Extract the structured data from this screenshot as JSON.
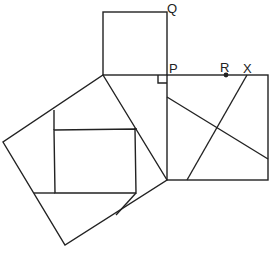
{
  "diagram": {
    "type": "pythagorean-dissection",
    "labels": {
      "Q": "Q",
      "P": "P",
      "R": "R",
      "X": "X"
    },
    "colors": {
      "stroke": "#222222",
      "background": "#ffffff"
    },
    "shapes": {
      "small_square": [
        [
          103,
          12
        ],
        [
          167,
          12
        ],
        [
          167,
          75
        ],
        [
          103,
          75
        ]
      ],
      "right_square": [
        [
          167,
          75
        ],
        [
          268,
          75
        ],
        [
          268,
          180
        ],
        [
          167,
          180
        ]
      ],
      "hypotenuse_square": [
        [
          103,
          75
        ],
        [
          167,
          180
        ],
        [
          65,
          245
        ],
        [
          3,
          142
        ]
      ],
      "inner_square": [
        [
          54,
          130
        ],
        [
          135,
          129
        ],
        [
          136,
          193
        ],
        [
          55,
          193
        ]
      ]
    },
    "points": {
      "R": [
        226,
        75
      ]
    }
  }
}
